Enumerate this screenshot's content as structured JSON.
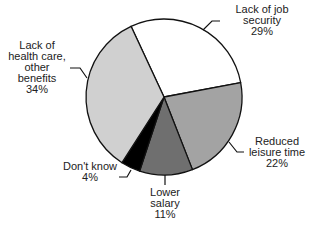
{
  "chart_data": {
    "type": "pie",
    "title": "",
    "start_angle_deg": 335,
    "direction": "clockwise",
    "slices": [
      {
        "label": "Lack of job security",
        "label_lines": [
          "Lack of job",
          "security"
        ],
        "value": 29,
        "value_label": "29%",
        "color": "#ffffff"
      },
      {
        "label": "Reduced leisure time",
        "label_lines": [
          "Reduced",
          "leisure time"
        ],
        "value": 22,
        "value_label": "22%",
        "color": "#a3a3a3"
      },
      {
        "label": "Lower salary",
        "label_lines": [
          "Lower",
          "salary"
        ],
        "value": 11,
        "value_label": "11%",
        "color": "#6f6f6f"
      },
      {
        "label": "Don't know",
        "label_lines": [
          "Don't know"
        ],
        "value": 4,
        "value_label": "4%",
        "color": "#000000"
      },
      {
        "label": "Lack of health care, other benefits",
        "label_lines": [
          "Lack of",
          "health care,",
          "other",
          "benefits"
        ],
        "value": 34,
        "value_label": "34%",
        "color": "#d0d0d0"
      }
    ]
  },
  "labels": {
    "job": {
      "l1": "Lack of job",
      "l2": "security",
      "pct": "29%"
    },
    "leisure": {
      "l1": "Reduced",
      "l2": "leisure time",
      "pct": "22%"
    },
    "salary": {
      "l1": "Lower",
      "l2": "salary",
      "pct": "11%"
    },
    "dontknow": {
      "l1": "Don't know",
      "pct": "4%"
    },
    "health": {
      "l1": "Lack of",
      "l2": "health care,",
      "l3": "other",
      "l4": "benefits",
      "pct": "34%"
    }
  }
}
